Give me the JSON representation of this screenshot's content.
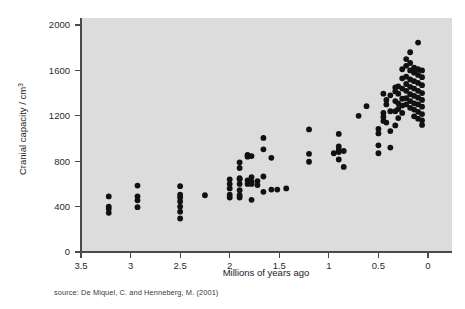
{
  "chart_data": {
    "type": "scatter",
    "title": "",
    "xlabel": "Millions of years ago",
    "ylabel": "Cranial capacity / cm",
    "ylabel_superscript": "3",
    "xlim": [
      3.5,
      0
    ],
    "ylim": [
      0,
      2000
    ],
    "x_reversed": true,
    "grid": false,
    "legend": null,
    "xticks": [
      3.5,
      3,
      2.5,
      2,
      1.5,
      1,
      0.5,
      0
    ],
    "xtick_labels": [
      "3.5",
      "3",
      "2.5",
      "2",
      "1.5",
      "1",
      "0.5",
      "0"
    ],
    "yticks": [
      0,
      400,
      800,
      1200,
      1600,
      2000
    ],
    "ytick_labels": [
      "0",
      "400",
      "800",
      "1200",
      "1600",
      "2000"
    ],
    "point_color": "#111111",
    "plot_background": "#dcdcdc",
    "page_background": "#ffffff",
    "points": [
      [
        3.22,
        490
      ],
      [
        3.22,
        400
      ],
      [
        3.22,
        380
      ],
      [
        3.22,
        345
      ],
      [
        2.93,
        585
      ],
      [
        2.93,
        490
      ],
      [
        2.93,
        455
      ],
      [
        2.93,
        395
      ],
      [
        2.5,
        580
      ],
      [
        2.5,
        505
      ],
      [
        2.5,
        480
      ],
      [
        2.5,
        445
      ],
      [
        2.5,
        400
      ],
      [
        2.5,
        355
      ],
      [
        2.5,
        295
      ],
      [
        2.25,
        500
      ],
      [
        2.0,
        640
      ],
      [
        2.0,
        600
      ],
      [
        2.0,
        560
      ],
      [
        2.0,
        505
      ],
      [
        2.0,
        480
      ],
      [
        1.9,
        790
      ],
      [
        1.9,
        740
      ],
      [
        1.9,
        650
      ],
      [
        1.9,
        640
      ],
      [
        1.9,
        600
      ],
      [
        1.9,
        545
      ],
      [
        1.9,
        500
      ],
      [
        1.9,
        480
      ],
      [
        1.82,
        855
      ],
      [
        1.82,
        840
      ],
      [
        1.82,
        630
      ],
      [
        1.82,
        600
      ],
      [
        1.78,
        845
      ],
      [
        1.78,
        660
      ],
      [
        1.78,
        620
      ],
      [
        1.78,
        600
      ],
      [
        1.78,
        460
      ],
      [
        1.72,
        625
      ],
      [
        1.72,
        590
      ],
      [
        1.66,
        1005
      ],
      [
        1.66,
        905
      ],
      [
        1.66,
        665
      ],
      [
        1.66,
        530
      ],
      [
        1.58,
        830
      ],
      [
        1.58,
        550
      ],
      [
        1.52,
        550
      ],
      [
        1.43,
        560
      ],
      [
        1.2,
        1080
      ],
      [
        1.2,
        865
      ],
      [
        1.2,
        795
      ],
      [
        0.95,
        870
      ],
      [
        0.9,
        1040
      ],
      [
        0.9,
        930
      ],
      [
        0.9,
        900
      ],
      [
        0.9,
        880
      ],
      [
        0.9,
        815
      ],
      [
        0.85,
        890
      ],
      [
        0.85,
        750
      ],
      [
        0.7,
        1200
      ],
      [
        0.62,
        1285
      ],
      [
        0.5,
        1085
      ],
      [
        0.5,
        1045
      ],
      [
        0.5,
        940
      ],
      [
        0.5,
        870
      ],
      [
        0.45,
        1395
      ],
      [
        0.45,
        1225
      ],
      [
        0.45,
        1190
      ],
      [
        0.45,
        1155
      ],
      [
        0.42,
        1340
      ],
      [
        0.42,
        1300
      ],
      [
        0.42,
        1140
      ],
      [
        0.38,
        1380
      ],
      [
        0.38,
        1240
      ],
      [
        0.38,
        1065
      ],
      [
        0.38,
        920
      ],
      [
        0.33,
        1450
      ],
      [
        0.33,
        1415
      ],
      [
        0.33,
        1330
      ],
      [
        0.33,
        1240
      ],
      [
        0.33,
        1115
      ],
      [
        0.3,
        1460
      ],
      [
        0.3,
        1395
      ],
      [
        0.3,
        1310
      ],
      [
        0.3,
        1260
      ],
      [
        0.3,
        1180
      ],
      [
        0.26,
        1610
      ],
      [
        0.26,
        1530
      ],
      [
        0.26,
        1440
      ],
      [
        0.26,
        1350
      ],
      [
        0.26,
        1290
      ],
      [
        0.26,
        1225
      ],
      [
        0.22,
        1700
      ],
      [
        0.22,
        1640
      ],
      [
        0.22,
        1545
      ],
      [
        0.22,
        1480
      ],
      [
        0.22,
        1420
      ],
      [
        0.22,
        1355
      ],
      [
        0.22,
        1300
      ],
      [
        0.18,
        1760
      ],
      [
        0.18,
        1665
      ],
      [
        0.18,
        1600
      ],
      [
        0.18,
        1520
      ],
      [
        0.18,
        1455
      ],
      [
        0.18,
        1390
      ],
      [
        0.18,
        1330
      ],
      [
        0.18,
        1270
      ],
      [
        0.14,
        1625
      ],
      [
        0.14,
        1580
      ],
      [
        0.14,
        1505
      ],
      [
        0.14,
        1440
      ],
      [
        0.14,
        1375
      ],
      [
        0.14,
        1310
      ],
      [
        0.14,
        1255
      ],
      [
        0.14,
        1195
      ],
      [
        0.1,
        1845
      ],
      [
        0.1,
        1610
      ],
      [
        0.1,
        1560
      ],
      [
        0.1,
        1490
      ],
      [
        0.1,
        1420
      ],
      [
        0.1,
        1360
      ],
      [
        0.1,
        1300
      ],
      [
        0.1,
        1235
      ],
      [
        0.1,
        1175
      ],
      [
        0.06,
        1600
      ],
      [
        0.06,
        1540
      ],
      [
        0.06,
        1470
      ],
      [
        0.06,
        1400
      ],
      [
        0.06,
        1340
      ],
      [
        0.06,
        1280
      ],
      [
        0.06,
        1215
      ],
      [
        0.06,
        1160
      ],
      [
        0.06,
        1120
      ]
    ]
  },
  "caption": {
    "source_text": "source: De Miquel, C. and Henneberg, M. (2001)"
  }
}
